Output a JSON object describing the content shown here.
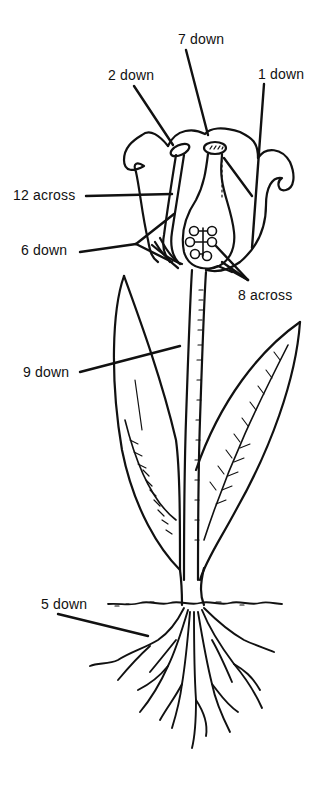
{
  "diagram": {
    "colors": {
      "ink": "#111111",
      "background": "#ffffff"
    },
    "labels": [
      {
        "id": "1-down",
        "text": "1 down",
        "x": 258,
        "y": 67
      },
      {
        "id": "2-down",
        "text": "2 down",
        "x": 108,
        "y": 68
      },
      {
        "id": "7-down",
        "text": "7 down",
        "x": 178,
        "y": 32
      },
      {
        "id": "12-across",
        "text": "12 across",
        "x": 13,
        "y": 188
      },
      {
        "id": "6-down",
        "text": "6 down",
        "x": 21,
        "y": 243
      },
      {
        "id": "8-across",
        "text": "8 across",
        "x": 238,
        "y": 288
      },
      {
        "id": "9-down",
        "text": "9 down",
        "x": 23,
        "y": 365
      },
      {
        "id": "5-down",
        "text": "5 down",
        "x": 41,
        "y": 597
      }
    ]
  }
}
